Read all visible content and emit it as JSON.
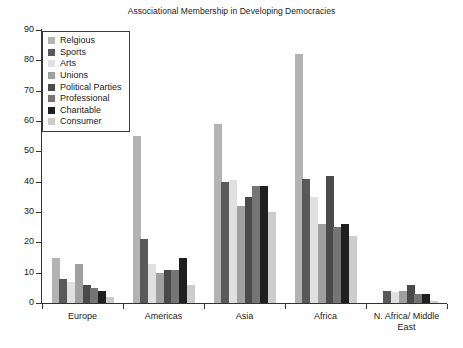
{
  "chart_data": {
    "type": "bar",
    "title": "Associational Membership in Developing Democracies",
    "xlabel": "",
    "ylabel": "",
    "ylim": [
      0,
      90
    ],
    "yticks": [
      0,
      10,
      20,
      30,
      40,
      50,
      60,
      70,
      80,
      90
    ],
    "grid": false,
    "legend_position": "top-left",
    "categories": [
      "Europe",
      "Americas",
      "Asia",
      "Africa",
      "N. Africa/ Middle East"
    ],
    "category_lines": [
      [
        "Europe"
      ],
      [
        "Americas"
      ],
      [
        "Asia"
      ],
      [
        "Africa"
      ],
      [
        "N. Africa/ Middle",
        "East"
      ]
    ],
    "series": [
      {
        "name": "Relgious",
        "color": "#b3b3b3",
        "values": [
          15,
          55,
          59,
          82,
          0
        ]
      },
      {
        "name": "Sports",
        "color": "#595959",
        "values": [
          8,
          21,
          40,
          41,
          4
        ]
      },
      {
        "name": "Arts",
        "color": "#e0e0e0",
        "values": [
          7,
          13,
          40.5,
          35,
          3.5
        ]
      },
      {
        "name": "Unions",
        "color": "#a0a0a0",
        "values": [
          13,
          10,
          32,
          26,
          4
        ]
      },
      {
        "name": "Political Parties",
        "color": "#4a4a4a",
        "values": [
          6,
          11,
          35,
          42,
          6
        ]
      },
      {
        "name": "Professional",
        "color": "#757575",
        "values": [
          5,
          11,
          38.5,
          25,
          3
        ]
      },
      {
        "name": "Charitable",
        "color": "#1f1f1f",
        "values": [
          4,
          15,
          38.5,
          26,
          3
        ]
      },
      {
        "name": "Consumer",
        "color": "#cccccc",
        "values": [
          2,
          6,
          30,
          22,
          0.5
        ]
      }
    ]
  },
  "colors": {
    "axis": "#333333",
    "text": "#1a1a1a",
    "background": "#ffffff",
    "legend_border": "#3a3a3a"
  }
}
